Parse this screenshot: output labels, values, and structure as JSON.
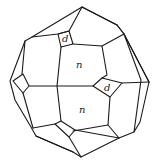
{
  "figure": {
    "face_labels": [
      {
        "id": "upper-d",
        "text": "d"
      },
      {
        "id": "upper-n",
        "text": "n"
      },
      {
        "id": "right-d",
        "text": "d"
      },
      {
        "id": "lower-n",
        "text": "n"
      }
    ],
    "line_color": "#1a1a1a",
    "background": "#ffffff"
  }
}
